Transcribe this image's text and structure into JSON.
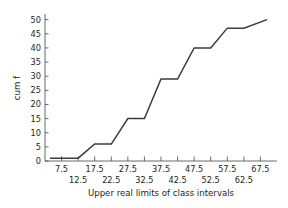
{
  "chart_data": {
    "type": "line",
    "title": "",
    "subtitle": "",
    "xlabel": "Upper real limits of class intervals",
    "ylabel": "cum f",
    "xlim": [
      2.5,
      72.5
    ],
    "ylim": [
      0,
      52
    ],
    "grid": false,
    "legend": null,
    "x_tick_labels": [
      "7.5",
      "12.5",
      "17.5",
      "22.5",
      "27.5",
      "32.5",
      "37.5",
      "42.5",
      "47.5",
      "52.5",
      "57.5",
      "62.5",
      "67.5"
    ],
    "x_tick_values": [
      7.5,
      12.5,
      17.5,
      22.5,
      27.5,
      32.5,
      37.5,
      42.5,
      47.5,
      52.5,
      57.5,
      62.5,
      67.5
    ],
    "x_tick_rows": [
      0,
      1,
      0,
      1,
      0,
      1,
      0,
      1,
      0,
      1,
      0,
      1,
      0
    ],
    "y_tick_labels": [
      "0",
      "5",
      "10",
      "15",
      "20",
      "25",
      "30",
      "35",
      "40",
      "45",
      "50"
    ],
    "y_tick_values": [
      0,
      5,
      10,
      15,
      20,
      25,
      30,
      35,
      40,
      45,
      50
    ],
    "categories": [
      "7.5",
      "12.5",
      "17.5",
      "22.5",
      "27.5",
      "32.5",
      "37.5",
      "42.5",
      "47.5",
      "52.5",
      "57.5",
      "62.5",
      "67.5"
    ],
    "values": [
      1,
      1,
      6,
      6,
      15,
      15,
      29,
      29,
      40,
      40,
      47,
      47,
      50
    ],
    "series": [
      {
        "name": "cum f",
        "color": "#3b3b3d",
        "points": [
          {
            "x": 4.0,
            "y": 1
          },
          {
            "x": 12.5,
            "y": 1
          },
          {
            "x": 17.5,
            "y": 6
          },
          {
            "x": 22.5,
            "y": 6
          },
          {
            "x": 27.5,
            "y": 15
          },
          {
            "x": 32.5,
            "y": 15
          },
          {
            "x": 37.5,
            "y": 29
          },
          {
            "x": 42.5,
            "y": 29
          },
          {
            "x": 47.5,
            "y": 40
          },
          {
            "x": 52.5,
            "y": 40
          },
          {
            "x": 57.5,
            "y": 47
          },
          {
            "x": 62.5,
            "y": 47
          },
          {
            "x": 69.5,
            "y": 50
          }
        ]
      }
    ],
    "annotations": []
  }
}
